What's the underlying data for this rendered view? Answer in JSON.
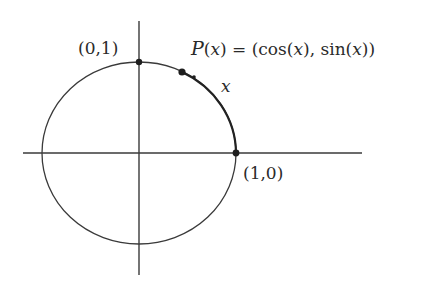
{
  "diagram": {
    "colors": {
      "stroke": "#3a3a3a",
      "point": "#1e1e1e",
      "text": "#2a2a2a",
      "background": "#ffffff"
    },
    "labels": {
      "top_point": "(0,1)",
      "right_point": "(1,0)",
      "p_prefix": "P",
      "p_arg": "x",
      "p_eq": ") = (cos(",
      "p_mid": "), sin(",
      "p_end": "))",
      "arc_label": "x"
    },
    "points": [
      {
        "name": "top",
        "coords": "(0,1)"
      },
      {
        "name": "P",
        "coords": "(cos(x), sin(x))"
      },
      {
        "name": "right",
        "coords": "(1,0)"
      }
    ]
  }
}
